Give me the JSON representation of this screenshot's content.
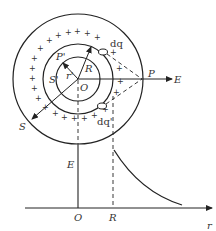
{
  "diagram": {
    "type": "uniformly charged spherical shell electric field",
    "labels": {
      "center": "O",
      "radius": "R",
      "inner_radius": "r'",
      "inner_point": "P'",
      "inner_gauss_surface": "S'",
      "outer_gauss_surface": "S",
      "outer_point": "P",
      "field": "E",
      "charge_element_top": "dq",
      "charge_element_bottom": "dq'"
    },
    "graph": {
      "y_label": "E",
      "x_label": "r",
      "origin_label": "O",
      "radius_tick_label": "R",
      "curve": "E = 0 for r < R; E ∝ 1/r² for r > R"
    },
    "charge_sign": "+",
    "colors": {
      "stroke": "#222222",
      "text": "#333333",
      "background": "#ffffff"
    }
  }
}
